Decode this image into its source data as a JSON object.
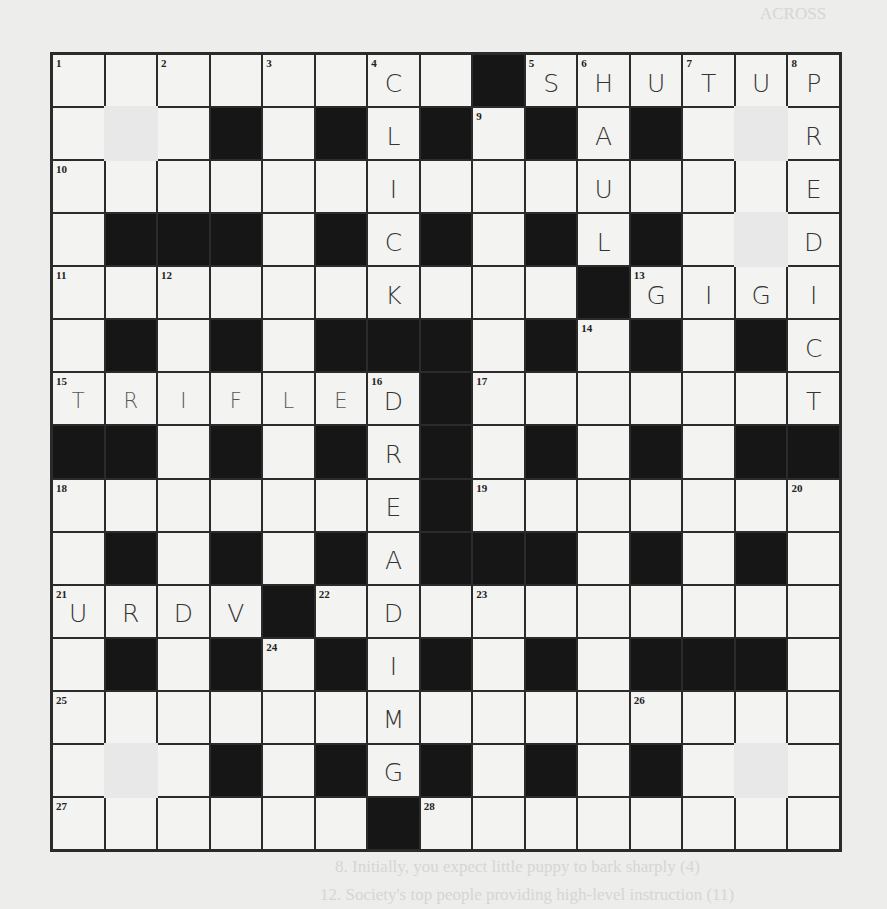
{
  "page": {
    "background_heading": "ACROSS",
    "background_down_heading": "DOWN",
    "background_clues_visible": [
      "8. Initially, you expect little puppy to bark sharply (4)",
      "12. Society's top people providing high-level instruction (11)"
    ]
  },
  "crossword": {
    "rows": 15,
    "cols": 15,
    "layout": [
      "........#......",
      ".P.#.#.#.#.#.P.",
      "...............",
      ".###.#.#.#.#.P.",
      "..........#....",
      ".#.#.###.#.#.#.",
      ".......#.......",
      "##.#.#.#.#.#.##",
      ".......#.......",
      ".#.#.#.###.#.#.",
      "....#..........",
      ".#.#.#.#.#.###.",
      "...............",
      ".P.#.#.#.#.#.P.",
      "......#........"
    ],
    "numbers": [
      {
        "r": 0,
        "c": 0,
        "n": "1"
      },
      {
        "r": 0,
        "c": 2,
        "n": "2"
      },
      {
        "r": 0,
        "c": 4,
        "n": "3"
      },
      {
        "r": 0,
        "c": 6,
        "n": "4"
      },
      {
        "r": 0,
        "c": 9,
        "n": "5"
      },
      {
        "r": 0,
        "c": 10,
        "n": "6"
      },
      {
        "r": 0,
        "c": 12,
        "n": "7"
      },
      {
        "r": 0,
        "c": 14,
        "n": "8"
      },
      {
        "r": 1,
        "c": 8,
        "n": "9"
      },
      {
        "r": 2,
        "c": 0,
        "n": "10"
      },
      {
        "r": 4,
        "c": 0,
        "n": "11"
      },
      {
        "r": 4,
        "c": 2,
        "n": "12"
      },
      {
        "r": 4,
        "c": 11,
        "n": "13"
      },
      {
        "r": 5,
        "c": 10,
        "n": "14"
      },
      {
        "r": 6,
        "c": 0,
        "n": "15"
      },
      {
        "r": 6,
        "c": 6,
        "n": "16"
      },
      {
        "r": 6,
        "c": 8,
        "n": "17"
      },
      {
        "r": 8,
        "c": 0,
        "n": "18"
      },
      {
        "r": 8,
        "c": 8,
        "n": "19"
      },
      {
        "r": 8,
        "c": 14,
        "n": "20"
      },
      {
        "r": 10,
        "c": 0,
        "n": "21"
      },
      {
        "r": 10,
        "c": 5,
        "n": "22"
      },
      {
        "r": 10,
        "c": 8,
        "n": "23"
      },
      {
        "r": 11,
        "c": 4,
        "n": "24"
      },
      {
        "r": 12,
        "c": 0,
        "n": "25"
      },
      {
        "r": 12,
        "c": 11,
        "n": "26"
      },
      {
        "r": 14,
        "c": 0,
        "n": "27"
      },
      {
        "r": 14,
        "c": 7,
        "n": "28"
      }
    ],
    "filled_letters": [
      {
        "r": 0,
        "c": 6,
        "ch": "C"
      },
      {
        "r": 0,
        "c": 9,
        "ch": "S"
      },
      {
        "r": 0,
        "c": 10,
        "ch": "H"
      },
      {
        "r": 0,
        "c": 11,
        "ch": "U"
      },
      {
        "r": 0,
        "c": 12,
        "ch": "T"
      },
      {
        "r": 0,
        "c": 13,
        "ch": "U"
      },
      {
        "r": 0,
        "c": 14,
        "ch": "P"
      },
      {
        "r": 1,
        "c": 6,
        "ch": "L"
      },
      {
        "r": 1,
        "c": 10,
        "ch": "A"
      },
      {
        "r": 1,
        "c": 14,
        "ch": "R"
      },
      {
        "r": 2,
        "c": 6,
        "ch": "I"
      },
      {
        "r": 2,
        "c": 10,
        "ch": "U"
      },
      {
        "r": 2,
        "c": 14,
        "ch": "E"
      },
      {
        "r": 3,
        "c": 6,
        "ch": "C"
      },
      {
        "r": 3,
        "c": 10,
        "ch": "L"
      },
      {
        "r": 3,
        "c": 14,
        "ch": "D"
      },
      {
        "r": 4,
        "c": 6,
        "ch": "K"
      },
      {
        "r": 4,
        "c": 11,
        "ch": "G"
      },
      {
        "r": 4,
        "c": 12,
        "ch": "I"
      },
      {
        "r": 4,
        "c": 13,
        "ch": "G"
      },
      {
        "r": 4,
        "c": 14,
        "ch": "I"
      },
      {
        "r": 5,
        "c": 14,
        "ch": "C"
      },
      {
        "r": 6,
        "c": 0,
        "ch": "T",
        "light": true
      },
      {
        "r": 6,
        "c": 1,
        "ch": "R",
        "light": true
      },
      {
        "r": 6,
        "c": 2,
        "ch": "I",
        "light": true
      },
      {
        "r": 6,
        "c": 3,
        "ch": "F",
        "light": true
      },
      {
        "r": 6,
        "c": 4,
        "ch": "L",
        "light": true
      },
      {
        "r": 6,
        "c": 5,
        "ch": "E",
        "light": true
      },
      {
        "r": 6,
        "c": 6,
        "ch": "D"
      },
      {
        "r": 6,
        "c": 14,
        "ch": "T"
      },
      {
        "r": 7,
        "c": 6,
        "ch": "R"
      },
      {
        "r": 8,
        "c": 6,
        "ch": "E"
      },
      {
        "r": 9,
        "c": 6,
        "ch": "A"
      },
      {
        "r": 10,
        "c": 0,
        "ch": "U"
      },
      {
        "r": 10,
        "c": 1,
        "ch": "R"
      },
      {
        "r": 10,
        "c": 2,
        "ch": "D"
      },
      {
        "r": 10,
        "c": 3,
        "ch": "V"
      },
      {
        "r": 10,
        "c": 6,
        "ch": "D"
      },
      {
        "r": 11,
        "c": 6,
        "ch": "I"
      },
      {
        "r": 12,
        "c": 6,
        "ch": "M"
      },
      {
        "r": 13,
        "c": 6,
        "ch": "G"
      }
    ],
    "answers_across": {
      "5": "SHUTUP",
      "13": "GIGI",
      "15": "TRIFLED",
      "21": "URDU"
    },
    "answers_down": {
      "4": "CLICK",
      "6": "HAUL",
      "8": "PREDICT",
      "16": "DREADIMG"
    }
  }
}
